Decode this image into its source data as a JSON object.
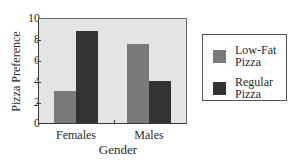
{
  "chart_data": {
    "type": "bar",
    "title": "",
    "xlabel": "Gender",
    "ylabel": "Pizza Preference",
    "categories": [
      "Females",
      "Males"
    ],
    "series": [
      {
        "name": "Low-Fat Pizza",
        "values": [
          3.1,
          7.6
        ],
        "color": "#7a7a7a"
      },
      {
        "name": "Regular Pizza",
        "values": [
          8.8,
          4.0
        ],
        "color": "#333333"
      }
    ],
    "ylim": [
      0,
      10
    ],
    "yticks": [
      "0",
      "2",
      "4",
      "6",
      "8",
      "10"
    ],
    "grid": false,
    "legend_position": "right",
    "plot_background": "#e4e4e4"
  },
  "legend": {
    "items": [
      {
        "line1": "Low-Fat",
        "line2": "Pizza"
      },
      {
        "line1": "Regular",
        "line2": "Pizza"
      }
    ]
  }
}
